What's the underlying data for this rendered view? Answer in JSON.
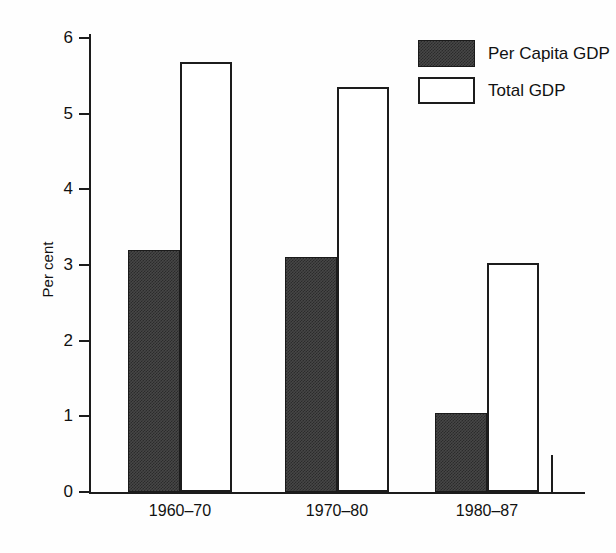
{
  "chart_data": {
    "type": "bar",
    "title": "",
    "subtitle": "",
    "xlabel": "",
    "ylabel": "Per cent",
    "categories": [
      "1960–70",
      "1970–80",
      "1980–87"
    ],
    "series": [
      {
        "name": "Per Capita GDP",
        "values": [
          3.2,
          3.1,
          1.05
        ],
        "fill": "#474747",
        "style": "dark-stipple"
      },
      {
        "name": "Total GDP",
        "values": [
          5.68,
          5.35,
          3.03
        ],
        "fill": "#ffffff",
        "style": "white-outline"
      }
    ],
    "ylim": [
      0,
      6
    ],
    "yticks": [
      0,
      1,
      2,
      3,
      4,
      5,
      6
    ],
    "ytick_labels": [
      "0",
      "1",
      "2",
      "3",
      "4",
      "5",
      "6"
    ],
    "grid": false,
    "legend_position": "top-right",
    "axis_color": "#1c1c1c",
    "background": "#fefefe"
  },
  "legend": {
    "entries": [
      {
        "label": "Per Capita GDP",
        "swatch": "dark"
      },
      {
        "label": "Total GDP",
        "swatch": "light"
      }
    ]
  }
}
